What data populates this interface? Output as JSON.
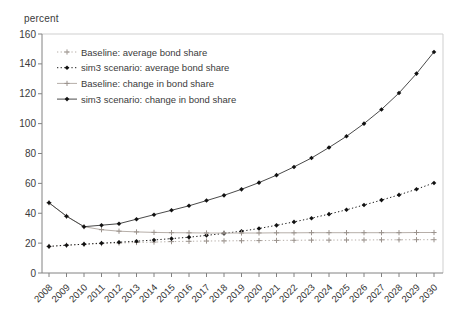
{
  "chart_data": {
    "type": "line",
    "title": "",
    "ylabel": "percent",
    "xlabel": "",
    "ylim": [
      0,
      160
    ],
    "ytick_step": 20,
    "grid": false,
    "legend_position": "upper-left",
    "x": [
      2008,
      2009,
      2010,
      2011,
      2012,
      2013,
      2014,
      2015,
      2016,
      2017,
      2018,
      2019,
      2020,
      2021,
      2022,
      2023,
      2024,
      2025,
      2026,
      2027,
      2028,
      2029,
      2030
    ],
    "series": [
      {
        "name": "Baseline: average bond share",
        "line": "dotted",
        "marker": "plus",
        "color": "#b6aea8",
        "marker_color": "#9a928c",
        "values": [
          17.8,
          18.6,
          19.2,
          19.7,
          20.1,
          20.4,
          20.7,
          21.0,
          21.2,
          21.4,
          21.5,
          21.6,
          21.7,
          21.8,
          21.9,
          22.0,
          22.0,
          22.1,
          22.1,
          22.2,
          22.2,
          22.3,
          22.3
        ]
      },
      {
        "name": "sim3 scenario: average bond share",
        "line": "dotted",
        "marker": "diamond",
        "color": "#1c1c1c",
        "marker_color": "#111111",
        "values": [
          17.8,
          18.6,
          19.3,
          20.0,
          20.6,
          21.3,
          22.1,
          23.0,
          24.0,
          25.2,
          26.5,
          28.0,
          29.8,
          31.9,
          34.2,
          36.7,
          39.4,
          42.3,
          45.5,
          48.8,
          52.3,
          56.1,
          60.3
        ]
      },
      {
        "name": "Baseline: change in bond share",
        "line": "solid",
        "marker": "plus",
        "color": "#b6aea8",
        "marker_color": "#9a928c",
        "values": [
          47.0,
          38.0,
          31.0,
          29.0,
          28.0,
          27.5,
          27.2,
          27.0,
          26.9,
          26.8,
          26.8,
          26.8,
          26.8,
          26.9,
          26.9,
          27.0,
          27.0,
          27.0,
          27.0,
          27.0,
          27.0,
          27.1,
          27.1
        ]
      },
      {
        "name": "sim3 scenario: change in bond share",
        "line": "solid",
        "marker": "diamond",
        "color": "#4a4a4a",
        "marker_color": "#111111",
        "values": [
          47.0,
          38.0,
          31.0,
          32.0,
          33.0,
          36.0,
          39.0,
          42.0,
          45.0,
          48.5,
          52.0,
          56.0,
          60.5,
          65.5,
          71.0,
          77.0,
          84.0,
          91.5,
          100.0,
          109.5,
          120.5,
          133.5,
          148.0
        ]
      }
    ]
  }
}
